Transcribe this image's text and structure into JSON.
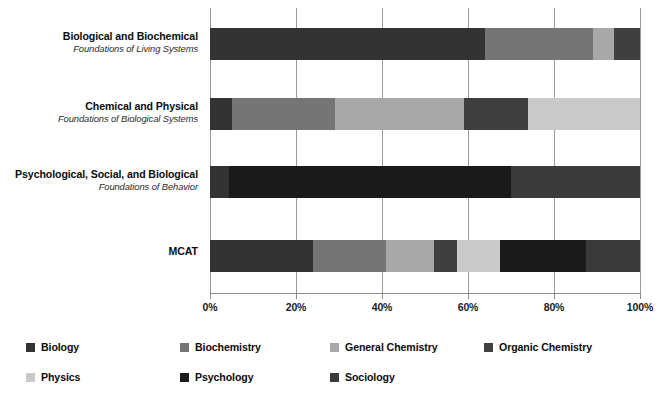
{
  "chart_data": {
    "type": "bar",
    "orientation": "horizontal",
    "stacked": true,
    "normalized": true,
    "title": "",
    "subtitle": "",
    "xlabel": "",
    "ylabel": "",
    "xlim": [
      0,
      100
    ],
    "xticks": [
      0,
      20,
      40,
      60,
      80,
      100
    ],
    "xticklabels": [
      "0%",
      "20%",
      "40%",
      "60%",
      "80%",
      "100%"
    ],
    "grid": true,
    "grid_axis": "x",
    "legend_position": "bottom",
    "categories": [
      "Biological and Biochemical Foundations of Living Systems",
      "Chemical and Physical Foundations of Biological Systems",
      "Psychological, Social, and Biological Foundations of Behavior",
      "MCAT"
    ],
    "category_labels": [
      {
        "main": "Biological and Biochemical",
        "sub": "Foundations of Living Systems"
      },
      {
        "main": "Chemical and Physical",
        "sub": "Foundations of Biological Systems"
      },
      {
        "main": "Psychological, Social, and Biological",
        "sub": "Foundations of Behavior"
      },
      {
        "main": "MCAT",
        "sub": ""
      }
    ],
    "series": [
      {
        "name": "Biology",
        "color": "#333333",
        "values": [
          64,
          5,
          4.5,
          24
        ]
      },
      {
        "name": "Biochemistry",
        "color": "#757575",
        "values": [
          25,
          24,
          0,
          17
        ]
      },
      {
        "name": "General Chemistry",
        "color": "#a8a8a8",
        "values": [
          5,
          30,
          0,
          11
        ]
      },
      {
        "name": "Organic Chemistry",
        "color": "#3f3f3f",
        "values": [
          6,
          15,
          0,
          5.5
        ]
      },
      {
        "name": "Physics",
        "color": "#c9c9c9",
        "values": [
          0,
          26,
          0,
          10
        ]
      },
      {
        "name": "Psychology",
        "color": "#1a1a1a",
        "values": [
          0,
          0,
          65.5,
          20
        ]
      },
      {
        "name": "Sociology",
        "color": "#3a3a3a",
        "values": [
          0,
          0,
          30,
          12.5
        ]
      }
    ]
  },
  "legend": {
    "items": [
      {
        "label": "Biology",
        "color": "#333333"
      },
      {
        "label": "Biochemistry",
        "color": "#757575"
      },
      {
        "label": "General Chemistry",
        "color": "#a8a8a8"
      },
      {
        "label": "Organic Chemistry",
        "color": "#3f3f3f"
      },
      {
        "label": "Physics",
        "color": "#c9c9c9"
      },
      {
        "label": "Psychology",
        "color": "#1a1a1a"
      },
      {
        "label": "Sociology",
        "color": "#3a3a3a"
      }
    ]
  },
  "axis": {
    "tick_labels": [
      "0%",
      "20%",
      "40%",
      "60%",
      "80%",
      "100%"
    ]
  }
}
